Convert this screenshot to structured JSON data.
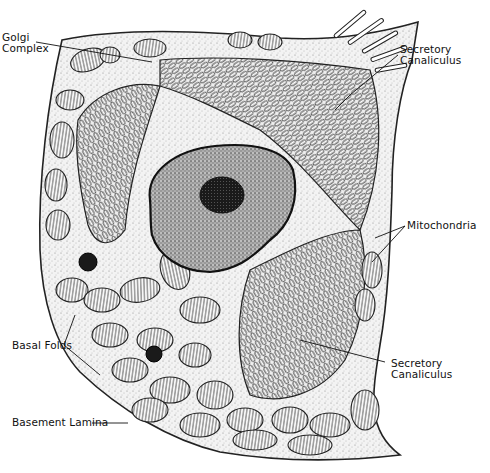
{
  "figure": {
    "colors": {
      "ink": "#111111",
      "cytoplasm": "#f1f1f1",
      "nucleus": "#8a8a8a",
      "nucleolus": "#1e1e1e",
      "background": "#ffffff"
    }
  },
  "labels": [
    {
      "id": "golgi",
      "lines": [
        "Golgi",
        "Complex"
      ]
    },
    {
      "id": "secretory-top",
      "lines": [
        "Secretory",
        "Canaliculus"
      ]
    },
    {
      "id": "mitochondria",
      "lines": [
        "Mitochondria"
      ]
    },
    {
      "id": "basal-folds",
      "lines": [
        "Basal Folds"
      ]
    },
    {
      "id": "secretory-bottom",
      "lines": [
        "Secretory",
        "Canaliculus"
      ]
    },
    {
      "id": "basement-lamina",
      "lines": [
        "Basement Lamina"
      ]
    }
  ]
}
